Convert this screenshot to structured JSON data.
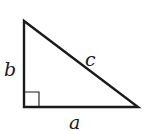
{
  "diagram": {
    "type": "right-triangle",
    "vertices": {
      "top": [
        24,
        21
      ],
      "bottom_left": [
        24,
        107
      ],
      "bottom_right": [
        138,
        107
      ]
    },
    "right_angle_marker_size": 15,
    "labels": {
      "a": "a",
      "b": "b",
      "c": "c"
    },
    "stroke_color": "#1a1a1a"
  }
}
